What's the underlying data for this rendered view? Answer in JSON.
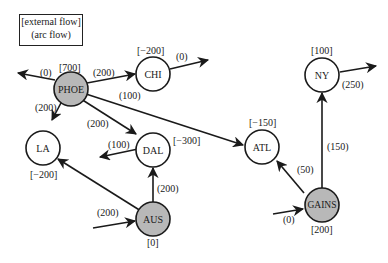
{
  "legend": {
    "line1": "[external flow]",
    "line2": "(arc flow)"
  },
  "colors": {
    "supply_node_fill": "#b8b8b8",
    "demand_node_fill": "#ffffff",
    "stroke": "#1a1a1a"
  },
  "nodes": [
    {
      "id": "PHOE",
      "label": "PHOE",
      "external": "[700]",
      "shaded": true
    },
    {
      "id": "CHI",
      "label": "CHI",
      "external": "[−200]",
      "shaded": false
    },
    {
      "id": "LA",
      "label": "LA",
      "external": "[−200]",
      "shaded": false
    },
    {
      "id": "DAL",
      "label": "DAL",
      "external": "[−300]",
      "shaded": false
    },
    {
      "id": "ATL",
      "label": "ATL",
      "external": "[−150]",
      "shaded": false
    },
    {
      "id": "NY",
      "label": "NY",
      "external": "[100]",
      "shaded": false
    },
    {
      "id": "AUS",
      "label": "AUS",
      "external": "[0]",
      "shaded": true
    },
    {
      "id": "GAINS",
      "label": "GAINS",
      "external": "[200]",
      "shaded": true
    }
  ],
  "arcs": [
    {
      "from": "PHOE",
      "to": "external-out",
      "flow": "(0)"
    },
    {
      "from": "PHOE",
      "to": "CHI",
      "flow": "(200)"
    },
    {
      "from": "PHOE",
      "to": "LA",
      "flow": "(200)"
    },
    {
      "from": "PHOE",
      "to": "DAL",
      "flow": "(200)"
    },
    {
      "from": "PHOE",
      "to": "ATL",
      "flow": "(100)"
    },
    {
      "from": "CHI",
      "to": "external-out",
      "flow": "(0)"
    },
    {
      "from": "DAL",
      "to": "external-out",
      "flow": "(100)"
    },
    {
      "from": "AUS",
      "to": "LA",
      "flow": ""
    },
    {
      "from": "AUS",
      "to": "DAL",
      "flow": "(200)"
    },
    {
      "from": "external-in",
      "to": "AUS",
      "flow": "(200)"
    },
    {
      "from": "GAINS",
      "to": "ATL",
      "flow": "(50)"
    },
    {
      "from": "GAINS",
      "to": "NY",
      "flow": "(150)"
    },
    {
      "from": "external-in",
      "to": "GAINS",
      "flow": "(0)"
    },
    {
      "from": "NY",
      "to": "external-out",
      "flow": "(250)"
    }
  ]
}
